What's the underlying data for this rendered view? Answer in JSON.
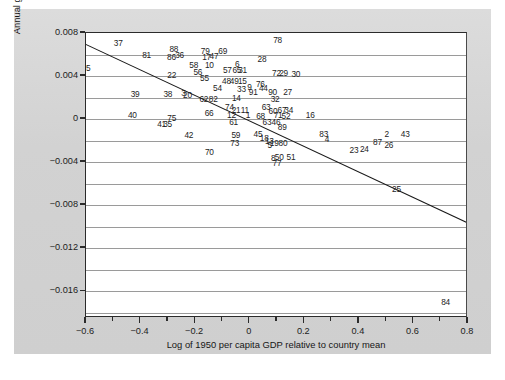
{
  "chart_data": {
    "type": "scatter",
    "title": "",
    "xlabel": "Log of 1950 per capita GDP relative to country mean",
    "ylabel": "Annual growth rate, 1950–1990 relative to country mean",
    "xlim": [
      -0.6,
      0.8
    ],
    "ylim": [
      -0.0185,
      0.008
    ],
    "xticks": [
      -0.6,
      -0.4,
      -0.2,
      0,
      0.2,
      0.4,
      0.6,
      0.8
    ],
    "xtick_labels": [
      "−0.6",
      "−0.4",
      "−0.2",
      "0",
      "0.2",
      "0.4",
      "0.6",
      "0.8"
    ],
    "xminor_step": 0.1,
    "yticks": [
      0.008,
      0.004,
      0,
      -0.004,
      -0.008,
      -0.012,
      -0.016
    ],
    "ytick_labels": [
      "0.008",
      "0.004",
      "0",
      "−0.004",
      "−0.008",
      "−0.012",
      "−0.016"
    ],
    "grid": "horizontal",
    "grid_step": 0.002,
    "legend": "none",
    "marker_style": "numeric-label",
    "regression_line": {
      "x1": -0.6,
      "y1": 0.00695,
      "x2": 0.8,
      "y2": -0.00965,
      "slope": -0.01186,
      "intercept": -0.00016
    },
    "points": [
      {
        "label": "37",
        "x": -0.482,
        "y": 0.00706
      },
      {
        "label": "85",
        "x": -0.6,
        "y": 0.00472
      },
      {
        "label": "81",
        "x": -0.378,
        "y": 0.00592
      },
      {
        "label": "88",
        "x": -0.278,
        "y": 0.00655
      },
      {
        "label": "86",
        "x": -0.287,
        "y": 0.00573
      },
      {
        "label": "36",
        "x": -0.257,
        "y": 0.00595
      },
      {
        "label": "79",
        "x": -0.163,
        "y": 0.00636
      },
      {
        "label": "17",
        "x": -0.158,
        "y": 0.0058
      },
      {
        "label": "47",
        "x": -0.131,
        "y": 0.00588
      },
      {
        "label": "69",
        "x": -0.099,
        "y": 0.00637
      },
      {
        "label": "78",
        "x": 0.102,
        "y": 0.00735
      },
      {
        "label": "28",
        "x": 0.045,
        "y": 0.00559
      },
      {
        "label": "58",
        "x": -0.205,
        "y": 0.00507
      },
      {
        "label": "10",
        "x": -0.148,
        "y": 0.00502
      },
      {
        "label": "6",
        "x": -0.046,
        "y": 0.0051
      },
      {
        "label": "22",
        "x": -0.286,
        "y": 0.00408
      },
      {
        "label": "56",
        "x": -0.19,
        "y": 0.00442
      },
      {
        "label": "57",
        "x": -0.082,
        "y": 0.00452
      },
      {
        "label": "65",
        "x": -0.047,
        "y": 0.00452
      },
      {
        "label": "31",
        "x": -0.026,
        "y": 0.00452
      },
      {
        "label": "72",
        "x": 0.098,
        "y": 0.00427
      },
      {
        "label": "29",
        "x": 0.124,
        "y": 0.00427
      },
      {
        "label": "30",
        "x": 0.169,
        "y": 0.00418
      },
      {
        "label": "55",
        "x": -0.166,
        "y": 0.00384
      },
      {
        "label": "48",
        "x": -0.085,
        "y": 0.00352
      },
      {
        "label": "49",
        "x": -0.057,
        "y": 0.00352
      },
      {
        "label": "15",
        "x": -0.027,
        "y": 0.00354
      },
      {
        "label": "76",
        "x": 0.039,
        "y": 0.00326
      },
      {
        "label": "39",
        "x": -0.42,
        "y": 0.00237
      },
      {
        "label": "38",
        "x": -0.3,
        "y": 0.00236
      },
      {
        "label": "3",
        "x": -0.243,
        "y": 0.00243
      },
      {
        "label": "20",
        "x": -0.228,
        "y": 0.00228
      },
      {
        "label": "54",
        "x": -0.118,
        "y": 0.00292
      },
      {
        "label": "33",
        "x": -0.03,
        "y": 0.00283
      },
      {
        "label": "9",
        "x": -0.001,
        "y": 0.00296
      },
      {
        "label": "44",
        "x": 0.05,
        "y": 0.00288
      },
      {
        "label": "91",
        "x": 0.013,
        "y": 0.00254
      },
      {
        "label": "90",
        "x": 0.084,
        "y": 0.0025
      },
      {
        "label": "27",
        "x": 0.139,
        "y": 0.00248
      },
      {
        "label": "40",
        "x": -0.43,
        "y": 0.00036
      },
      {
        "label": "75",
        "x": -0.286,
        "y": 8e-05
      },
      {
        "label": "62",
        "x": -0.168,
        "y": 0.00188
      },
      {
        "label": "82",
        "x": -0.134,
        "y": 0.00186
      },
      {
        "label": "14",
        "x": -0.049,
        "y": 0.00194
      },
      {
        "label": "32",
        "x": 0.093,
        "y": 0.00186
      },
      {
        "label": "66",
        "x": -0.149,
        "y": 0.00058
      },
      {
        "label": "74",
        "x": -0.074,
        "y": 0.00115
      },
      {
        "label": "21",
        "x": -0.05,
        "y": 0.00085
      },
      {
        "label": "11",
        "x": -0.018,
        "y": 0.00083
      },
      {
        "label": "63",
        "x": 0.06,
        "y": 0.00111
      },
      {
        "label": "60",
        "x": 0.085,
        "y": 0.00077
      },
      {
        "label": "67",
        "x": 0.118,
        "y": 0.00083
      },
      {
        "label": "34",
        "x": 0.143,
        "y": 0.00083
      },
      {
        "label": "12",
        "x": -0.067,
        "y": 0.0004
      },
      {
        "label": "1",
        "x": -0.006,
        "y": 0.00042
      },
      {
        "label": "68",
        "x": 0.04,
        "y": 0.00032
      },
      {
        "label": "71",
        "x": 0.104,
        "y": 0.00038
      },
      {
        "label": "52",
        "x": 0.133,
        "y": 0.0003
      },
      {
        "label": "16",
        "x": 0.222,
        "y": 0.00037
      },
      {
        "label": "41",
        "x": -0.323,
        "y": -0.00049
      },
      {
        "label": "35",
        "x": -0.301,
        "y": -0.00049
      },
      {
        "label": "61",
        "x": -0.059,
        "y": -0.00025
      },
      {
        "label": "63b",
        "x": 0.063,
        "y": -0.00025
      },
      {
        "label": "46",
        "x": 0.096,
        "y": -0.00028
      },
      {
        "label": "89",
        "x": 0.119,
        "y": -0.00075
      },
      {
        "label": "42",
        "x": -0.223,
        "y": -0.00147
      },
      {
        "label": "59",
        "x": -0.051,
        "y": -0.00145
      },
      {
        "label": "45",
        "x": 0.03,
        "y": -0.0014
      },
      {
        "label": "83",
        "x": 0.271,
        "y": -0.00141
      },
      {
        "label": "2",
        "x": 0.502,
        "y": -0.0014
      },
      {
        "label": "43",
        "x": 0.57,
        "y": -0.00137
      },
      {
        "label": "4",
        "x": 0.283,
        "y": -0.0019
      },
      {
        "label": "18",
        "x": 0.053,
        "y": -0.00178
      },
      {
        "label": "13",
        "x": 0.072,
        "y": -0.00203
      },
      {
        "label": "73",
        "x": -0.055,
        "y": -0.00222
      },
      {
        "label": "5",
        "x": 0.073,
        "y": -0.00245
      },
      {
        "label": "19",
        "x": 0.09,
        "y": -0.00222
      },
      {
        "label": "80",
        "x": 0.122,
        "y": -0.00222
      },
      {
        "label": "87",
        "x": 0.468,
        "y": -0.00215
      },
      {
        "label": "26",
        "x": 0.51,
        "y": -0.00237
      },
      {
        "label": "23",
        "x": 0.382,
        "y": -0.00288
      },
      {
        "label": "24",
        "x": 0.42,
        "y": -0.0028
      },
      {
        "label": "70",
        "x": -0.148,
        "y": -0.0031
      },
      {
        "label": "8",
        "x": 0.086,
        "y": -0.00365
      },
      {
        "label": "50",
        "x": 0.108,
        "y": -0.0035
      },
      {
        "label": "51",
        "x": 0.151,
        "y": -0.00355
      },
      {
        "label": "77",
        "x": 0.1,
        "y": -0.0041
      },
      {
        "label": "25",
        "x": 0.538,
        "y": -0.00655
      },
      {
        "label": "84",
        "x": 0.718,
        "y": -0.017
      }
    ]
  }
}
